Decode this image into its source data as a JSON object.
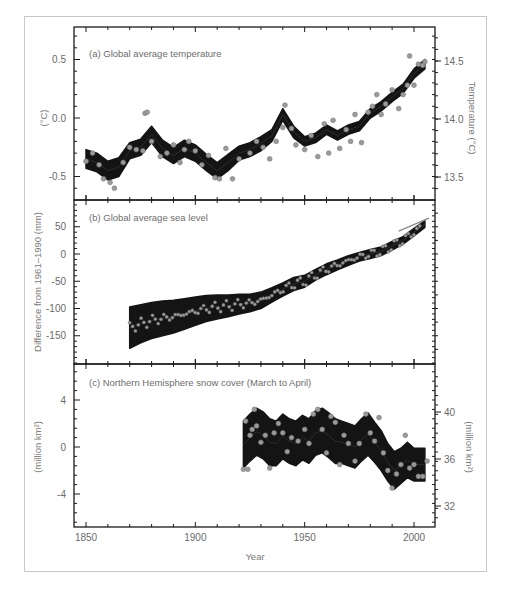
{
  "figure": {
    "xlabel": "Year"
  },
  "chart_data": [
    {
      "type": "line",
      "panel": "a",
      "title": "(a) Global average temperature",
      "xlabel": "Year",
      "ylabel": "(°C)",
      "ylabel_right": "Temperature (°C)",
      "xlim": [
        1845,
        2010
      ],
      "ylim": [
        -0.7,
        0.75
      ],
      "ylim_right": [
        13.3,
        14.75
      ],
      "xticks": [
        1850,
        1900,
        1950,
        2000
      ],
      "yticks": [
        -0.5,
        0.0,
        0.5
      ],
      "yticks_right": [
        13.5,
        14.0,
        14.5
      ],
      "grid": false,
      "series": [
        {
          "name": "smoothed decadal with uncertainty band",
          "x": [
            1850,
            1855,
            1860,
            1865,
            1870,
            1875,
            1880,
            1885,
            1890,
            1895,
            1900,
            1905,
            1910,
            1915,
            1920,
            1925,
            1930,
            1935,
            1940,
            1945,
            1950,
            1955,
            1960,
            1965,
            1970,
            1975,
            1980,
            1985,
            1990,
            1995,
            2000,
            2005
          ],
          "values": [
            -0.35,
            -0.38,
            -0.45,
            -0.42,
            -0.28,
            -0.25,
            -0.14,
            -0.26,
            -0.32,
            -0.26,
            -0.3,
            -0.38,
            -0.45,
            -0.38,
            -0.3,
            -0.27,
            -0.22,
            -0.15,
            0.03,
            -0.12,
            -0.2,
            -0.17,
            -0.1,
            -0.15,
            -0.1,
            -0.07,
            0.04,
            0.1,
            0.18,
            0.25,
            0.38,
            0.46
          ],
          "band_halfwidth": [
            0.08,
            0.08,
            0.08,
            0.08,
            0.07,
            0.07,
            0.07,
            0.07,
            0.07,
            0.07,
            0.07,
            0.07,
            0.07,
            0.07,
            0.06,
            0.06,
            0.06,
            0.05,
            0.05,
            0.05,
            0.04,
            0.04,
            0.04,
            0.04,
            0.04,
            0.04,
            0.04,
            0.04,
            0.04,
            0.04,
            0.04,
            0.04
          ]
        }
      ],
      "annual_points_sample": [
        [
          1850,
          -0.37
        ],
        [
          1853,
          -0.3
        ],
        [
          1856,
          -0.4
        ],
        [
          1858,
          -0.52
        ],
        [
          1861,
          -0.55
        ],
        [
          1863,
          -0.6
        ],
        [
          1867,
          -0.38
        ],
        [
          1870,
          -0.25
        ],
        [
          1873,
          -0.27
        ],
        [
          1876,
          -0.28
        ],
        [
          1877,
          0.04
        ],
        [
          1878,
          0.05
        ],
        [
          1880,
          -0.2
        ],
        [
          1884,
          -0.33
        ],
        [
          1887,
          -0.3
        ],
        [
          1890,
          -0.23
        ],
        [
          1893,
          -0.38
        ],
        [
          1895,
          -0.27
        ],
        [
          1897,
          -0.2
        ],
        [
          1900,
          -0.28
        ],
        [
          1903,
          -0.4
        ],
        [
          1906,
          -0.32
        ],
        [
          1909,
          -0.51
        ],
        [
          1911,
          -0.52
        ],
        [
          1914,
          -0.26
        ],
        [
          1917,
          -0.52
        ],
        [
          1920,
          -0.35
        ],
        [
          1925,
          -0.3
        ],
        [
          1928,
          -0.2
        ],
        [
          1931,
          -0.25
        ],
        [
          1934,
          -0.35
        ],
        [
          1937,
          -0.2
        ],
        [
          1940,
          -0.08
        ],
        [
          1941,
          0.11
        ],
        [
          1944,
          -0.09
        ],
        [
          1946,
          -0.23
        ],
        [
          1950,
          -0.27
        ],
        [
          1953,
          -0.15
        ],
        [
          1956,
          -0.33
        ],
        [
          1959,
          -0.05
        ],
        [
          1961,
          -0.3
        ],
        [
          1963,
          -0.02
        ],
        [
          1966,
          -0.26
        ],
        [
          1969,
          -0.1
        ],
        [
          1971,
          -0.2
        ],
        [
          1973,
          0.03
        ],
        [
          1976,
          -0.21
        ],
        [
          1979,
          0.05
        ],
        [
          1981,
          0.1
        ],
        [
          1983,
          0.2
        ],
        [
          1985,
          0.03
        ],
        [
          1987,
          0.12
        ],
        [
          1990,
          0.24
        ],
        [
          1993,
          0.08
        ],
        [
          1995,
          0.2
        ],
        [
          1997,
          0.28
        ],
        [
          1998,
          0.53
        ],
        [
          2000,
          0.28
        ],
        [
          2002,
          0.46
        ],
        [
          2004,
          0.45
        ],
        [
          2005,
          0.48
        ]
      ]
    },
    {
      "type": "line",
      "panel": "b",
      "title": "(b) Global average sea level",
      "xlabel": "Year",
      "ylabel": "Difference from 1961–1990 (mm)",
      "xlim": [
        1845,
        2010
      ],
      "ylim": [
        -200,
        100
      ],
      "xticks": [
        1850,
        1900,
        1950,
        2000
      ],
      "yticks": [
        -150,
        -100,
        -50,
        0,
        50
      ],
      "grid": false,
      "series": [
        {
          "name": "sea level (smoothed) with uncertainty band",
          "x": [
            1870,
            1875,
            1880,
            1885,
            1890,
            1895,
            1900,
            1905,
            1910,
            1915,
            1920,
            1925,
            1930,
            1935,
            1940,
            1945,
            1950,
            1955,
            1960,
            1965,
            1970,
            1975,
            1980,
            1985,
            1990,
            1995,
            2000,
            2005
          ],
          "values": [
            -135,
            -128,
            -122,
            -118,
            -115,
            -110,
            -105,
            -100,
            -97,
            -95,
            -92,
            -90,
            -85,
            -75,
            -65,
            -55,
            -50,
            -38,
            -28,
            -20,
            -12,
            -5,
            0,
            5,
            15,
            25,
            40,
            55
          ],
          "band_halfwidth": [
            38,
            35,
            33,
            32,
            30,
            28,
            26,
            24,
            22,
            20,
            18,
            16,
            15,
            13,
            12,
            12,
            11,
            10,
            10,
            9,
            9,
            8,
            8,
            8,
            8,
            7,
            7,
            6
          ]
        }
      ],
      "satellite_altimetry": {
        "x": [
          1993,
          2005
        ],
        "values": [
          42,
          62
        ]
      }
    },
    {
      "type": "line",
      "panel": "c",
      "title": "(c) Northern Hemisphere snow cover (March to April)",
      "xlabel": "Year",
      "ylabel": "(million km²)",
      "ylabel_right": "(million km²)",
      "xlim": [
        1845,
        2010
      ],
      "ylim": [
        -7,
        7
      ],
      "ylim_right": [
        31,
        43
      ],
      "xticks": [
        1850,
        1900,
        1950,
        2000
      ],
      "yticks": [
        -4,
        0,
        4
      ],
      "yticks_right": [
        32,
        36,
        40
      ],
      "grid": false,
      "series": [
        {
          "name": "snow cover anomaly (smoothed) with uncertainty band",
          "x": [
            1922,
            1925,
            1928,
            1931,
            1934,
            1937,
            1940,
            1943,
            1946,
            1949,
            1952,
            1955,
            1958,
            1961,
            1964,
            1967,
            1970,
            1973,
            1976,
            1979,
            1982,
            1985,
            1988,
            1991,
            1994,
            1997,
            2000,
            2003,
            2005
          ],
          "values": [
            0.2,
            0.8,
            1.3,
            1.0,
            0.4,
            0.3,
            0.9,
            0.5,
            0.3,
            0.8,
            0.5,
            1.2,
            1.4,
            1.0,
            0.5,
            0.4,
            0.2,
            0.0,
            0.6,
            1.1,
            0.4,
            -0.3,
            -1.3,
            -2.0,
            -1.6,
            -1.1,
            -1.5,
            -1.5,
            -1.5
          ],
          "band_halfwidth": [
            2.0,
            2.0,
            2.0,
            2.0,
            2.0,
            1.9,
            1.9,
            1.9,
            1.9,
            1.9,
            1.9,
            1.9,
            1.9,
            1.9,
            1.9,
            1.8,
            1.8,
            1.8,
            1.8,
            1.8,
            1.7,
            1.7,
            1.6,
            1.6,
            1.5,
            1.5,
            1.4,
            1.4,
            1.4
          ]
        }
      ],
      "annual_points_sample": [
        [
          1922,
          -1.9
        ],
        [
          1923,
          2.2
        ],
        [
          1924,
          -1.9
        ],
        [
          1925,
          1.0
        ],
        [
          1926,
          1.5
        ],
        [
          1927,
          3.2
        ],
        [
          1928,
          1.8
        ],
        [
          1930,
          0.4
        ],
        [
          1932,
          1.0
        ],
        [
          1934,
          -1.8
        ],
        [
          1936,
          1.2
        ],
        [
          1938,
          2.0
        ],
        [
          1940,
          1.2
        ],
        [
          1942,
          -0.4
        ],
        [
          1944,
          0.8
        ],
        [
          1947,
          0.5
        ],
        [
          1950,
          1.5
        ],
        [
          1952,
          0.3
        ],
        [
          1954,
          2.8
        ],
        [
          1956,
          3.2
        ],
        [
          1958,
          1.5
        ],
        [
          1960,
          -0.5
        ],
        [
          1962,
          2.6
        ],
        [
          1964,
          2.1
        ],
        [
          1966,
          -1.5
        ],
        [
          1968,
          1.0
        ],
        [
          1970,
          0.3
        ],
        [
          1973,
          -1.2
        ],
        [
          1975,
          0.3
        ],
        [
          1978,
          2.8
        ],
        [
          1980,
          1.2
        ],
        [
          1982,
          0.5
        ],
        [
          1984,
          2.5
        ],
        [
          1986,
          -0.5
        ],
        [
          1988,
          -2.0
        ],
        [
          1990,
          -3.5
        ],
        [
          1992,
          -2.3
        ],
        [
          1994,
          -1.5
        ],
        [
          1996,
          1.0
        ],
        [
          1998,
          -1.8
        ],
        [
          2000,
          -1.5
        ],
        [
          2002,
          -2.5
        ],
        [
          2004,
          -2.5
        ],
        [
          2006,
          -1.2
        ]
      ]
    }
  ]
}
